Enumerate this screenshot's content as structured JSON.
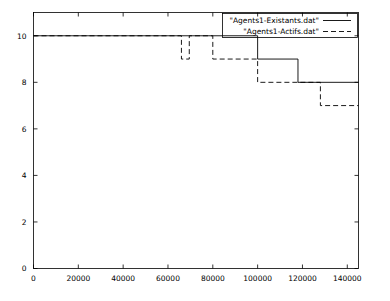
{
  "chart_data": {
    "type": "line",
    "title": "",
    "xlabel": "",
    "ylabel": "",
    "xlim": [
      0,
      145000
    ],
    "ylim": [
      0,
      11
    ],
    "grid": false,
    "legend_position": "top-right",
    "xticks": [
      0,
      20000,
      40000,
      60000,
      80000,
      100000,
      120000,
      140000
    ],
    "xtick_labels": [
      "0",
      "20000",
      "40000",
      "60000",
      "80000",
      "100000",
      "120000",
      "140000"
    ],
    "yticks": [
      0,
      2,
      4,
      6,
      8,
      10
    ],
    "ytick_labels": [
      "0",
      "2",
      "4",
      "6",
      "8",
      "10"
    ],
    "series": [
      {
        "name": "\"Agents1-Existants.dat\"",
        "style": "solid",
        "points": [
          [
            0,
            10
          ],
          [
            100000,
            10
          ],
          [
            100000,
            9
          ],
          [
            118000,
            9
          ],
          [
            118000,
            8
          ],
          [
            145000,
            8
          ]
        ]
      },
      {
        "name": "\"Agents1-Actifs.dat\"",
        "style": "dashed",
        "points": [
          [
            0,
            10
          ],
          [
            66000,
            10
          ],
          [
            66000,
            9
          ],
          [
            69500,
            9
          ],
          [
            69500,
            10
          ],
          [
            80000,
            10
          ],
          [
            80000,
            9
          ],
          [
            100000,
            9
          ],
          [
            100000,
            8
          ],
          [
            128000,
            8
          ],
          [
            128000,
            7
          ],
          [
            145000,
            7
          ]
        ]
      }
    ]
  },
  "legend": {
    "entries": [
      {
        "label": "\"Agents1-Existants.dat\"",
        "style": "solid"
      },
      {
        "label": "\"Agents1-Actifs.dat\"",
        "style": "dashed"
      }
    ]
  }
}
